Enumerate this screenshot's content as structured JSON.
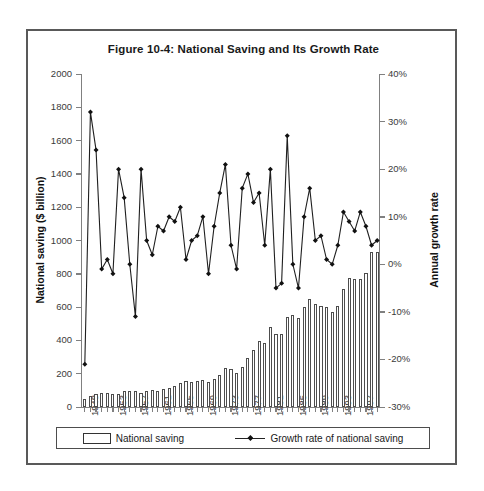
{
  "figure": {
    "title": "Figure 10-4: National Saving and Its Growth Rate"
  },
  "legend": {
    "bar_label": "National saving",
    "line_label": "Growth rate of national saving"
  },
  "chart_data": {
    "type": "bar",
    "title": "Figure 10-4: National Saving and Its Growth Rate",
    "xlabel": "",
    "ylabel": "National saving ($ billion)",
    "y2label": "Annual growth rate",
    "ylim": [
      0,
      2000
    ],
    "y2lim": [
      -0.3,
      0.4
    ],
    "ytick_labels": [
      "0",
      "200",
      "400",
      "600",
      "800",
      "1000",
      "1200",
      "1400",
      "1600",
      "1800",
      "2000"
    ],
    "ytick_values": [
      0,
      200,
      400,
      600,
      800,
      1000,
      1200,
      1400,
      1600,
      1800,
      2000
    ],
    "y2tick_labels": [
      "-30%",
      "-20%",
      "-10%",
      "0%",
      "10%",
      "20%",
      "30%",
      "40%"
    ],
    "y2tick_values": [
      -30,
      -20,
      -10,
      0,
      10,
      20,
      30,
      40
    ],
    "grid": false,
    "legend_position": "bottom",
    "categories": [
      1948,
      1949,
      1950,
      1951,
      1952,
      1953,
      1954,
      1955,
      1956,
      1957,
      1958,
      1959,
      1960,
      1961,
      1962,
      1963,
      1964,
      1965,
      1966,
      1967,
      1968,
      1969,
      1970,
      1971,
      1972,
      1973,
      1974,
      1975,
      1976,
      1977,
      1978,
      1979,
      1980,
      1981,
      1982,
      1983,
      1984,
      1985,
      1986,
      1987,
      1988,
      1989,
      1990,
      1991,
      1992,
      1993,
      1994,
      1995,
      1996,
      1997,
      1998,
      1999,
      2000
    ],
    "xtick_labels": [
      "1948",
      "1953",
      "1957",
      "1961",
      "1965",
      "1969",
      "1973",
      "1977",
      "1981",
      "1985",
      "1989",
      "1993",
      "1997"
    ],
    "xtick_years": [
      1948,
      1953,
      1957,
      1961,
      1965,
      1969,
      1973,
      1977,
      1981,
      1985,
      1989,
      1993,
      1997
    ],
    "series": [
      {
        "name": "National saving",
        "axis": "left",
        "unit": "$ billion",
        "values": [
          49,
          65,
          80,
          83,
          82,
          81,
          80,
          96,
          96,
          96,
          86,
          98,
          100,
          99,
          107,
          113,
          127,
          143,
          155,
          151,
          157,
          165,
          152,
          166,
          192,
          232,
          229,
          206,
          240,
          292,
          345,
          396,
          382,
          478,
          438,
          440,
          543,
          553,
          537,
          602,
          650,
          620,
          604,
          600,
          568,
          604,
          711,
          772,
          770,
          769,
          806,
          932,
          930
        ]
      },
      {
        "name": "Growth rate of national saving",
        "axis": "right",
        "unit": "percent",
        "values": [
          -21,
          32,
          24,
          -1,
          1,
          -2,
          20,
          14,
          0,
          -11,
          20,
          5,
          2,
          8,
          7,
          10,
          9,
          12,
          1,
          5,
          6,
          10,
          -2,
          8,
          15,
          21,
          4,
          -1,
          16,
          19,
          13,
          15,
          4,
          20,
          -5,
          -4,
          27,
          0,
          -5,
          10,
          16,
          5,
          6,
          1,
          0,
          4,
          11,
          9,
          7,
          11,
          8,
          4,
          5
        ]
      }
    ]
  }
}
